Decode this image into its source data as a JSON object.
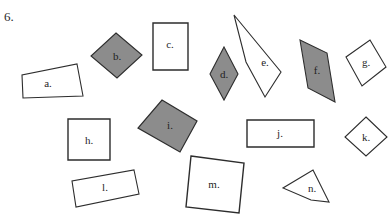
{
  "worksheet": {
    "question_number": "6.",
    "background_color": "#ffffff",
    "outline_color": "#2d2d2d",
    "fill_white": "#ffffff",
    "fill_gray": "#8c8c8c",
    "label_color": "#1f1f1f"
  },
  "shapes": [
    {
      "id": "a",
      "label": "a.",
      "kind": "quadrilateral-trapezoid",
      "fill": "white",
      "points": "77,64 83,96 23,98 22,75",
      "stroke_width": 1.1,
      "label_x": 48,
      "label_y": 84
    },
    {
      "id": "b",
      "label": "b.",
      "kind": "rhombus-diamond",
      "fill": "gray",
      "points": "116,33 142,55 117,78 91,56",
      "stroke_width": 1.1,
      "label_x": 117,
      "label_y": 57
    },
    {
      "id": "c",
      "label": "c.",
      "kind": "rectangle",
      "fill": "white",
      "points": "153,23 188,23 188,70 153,70",
      "stroke_width": 1.4,
      "label_x": 170,
      "label_y": 45
    },
    {
      "id": "d",
      "label": "d.",
      "kind": "rhombus-tall",
      "fill": "gray",
      "points": "224,47 238,74 224,100 210,74",
      "stroke_width": 1.1,
      "label_x": 224,
      "label_y": 75
    },
    {
      "id": "e",
      "label": "e.",
      "kind": "concave-dart",
      "fill": "white",
      "points": "234,15 281,72 265,97 246,62",
      "stroke_width": 1.1,
      "label_x": 265,
      "label_y": 63
    },
    {
      "id": "f",
      "label": "f.",
      "kind": "parallelogram",
      "fill": "gray",
      "points": "300,40 327,53 335,102 308,88"
    },
    {
      "id": "g",
      "label": "g.",
      "kind": "rectangle-rotated",
      "fill": "white",
      "points": "370,40 386,67 362,86 346,57",
      "stroke_width": 1.1,
      "label_x": 366,
      "label_y": 63
    },
    {
      "id": "h",
      "label": "h.",
      "kind": "square",
      "fill": "white",
      "points": "68,119 110,119 110,160 68,160",
      "stroke_width": 1.4,
      "label_x": 89,
      "label_y": 141
    },
    {
      "id": "i",
      "label": "i.",
      "kind": "rhombus-rotated-square",
      "fill": "gray",
      "points": "162,100 197,121 180,152 138,128",
      "stroke_width": 1.2,
      "label_x": 170,
      "label_y": 126
    },
    {
      "id": "j",
      "label": "j.",
      "kind": "rectangle-wide",
      "fill": "white",
      "points": "247,120 314,120 314,147 247,147",
      "stroke_width": 1.4,
      "label_x": 280,
      "label_y": 134
    },
    {
      "id": "k",
      "label": "k.",
      "kind": "diamond-small",
      "fill": "white",
      "points": "366,117 387,137 366,156 345,137",
      "stroke_width": 1.1,
      "label_x": 366,
      "label_y": 138
    },
    {
      "id": "l",
      "label": "l.",
      "kind": "rectangle-rotated",
      "fill": "white",
      "points": "134,170 139,194 76,207 72,181",
      "stroke_width": 1.1,
      "label_x": 105,
      "label_y": 188
    },
    {
      "id": "m",
      "label": "m.",
      "kind": "square-rotated",
      "fill": "white",
      "points": "191,156 244,163 239,213 186,207",
      "stroke_width": 1.4,
      "label_x": 214,
      "label_y": 185
    },
    {
      "id": "n",
      "label": "n.",
      "kind": "quadrilateral-kite",
      "fill": "white",
      "points": "313,170 329,202 311,200 283,188",
      "stroke_width": 1.1,
      "label_x": 312,
      "label_y": 189
    }
  ],
  "shape_f_extra": {
    "stroke_width": 1.1,
    "label_x": 317,
    "label_y": 71
  }
}
